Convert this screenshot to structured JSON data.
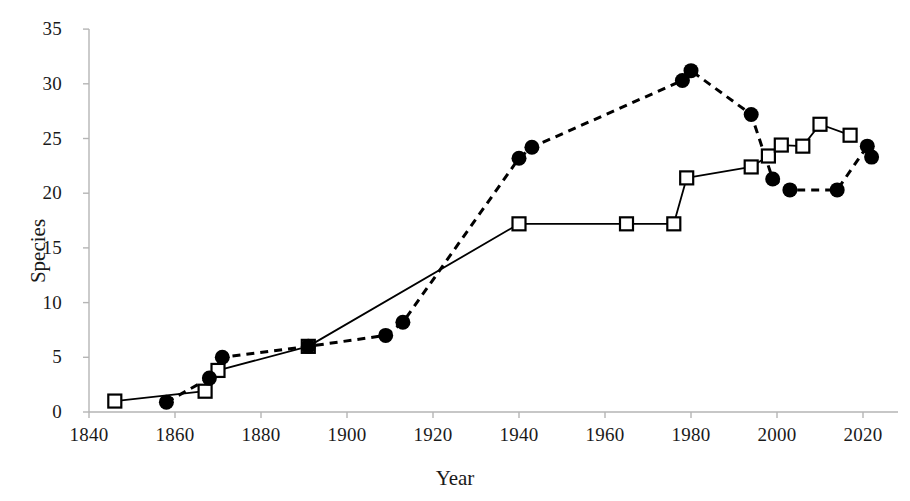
{
  "chart_data": {
    "type": "line",
    "title": "",
    "xlabel": "Year",
    "ylabel": "Species",
    "xlim": [
      1840,
      2024
    ],
    "ylim": [
      0,
      35
    ],
    "xticks": [
      1840,
      1860,
      1880,
      1900,
      1920,
      1940,
      1960,
      1980,
      2000,
      2020
    ],
    "yticks": [
      0,
      5,
      10,
      15,
      20,
      25,
      30,
      35
    ],
    "grid": false,
    "legend": "none",
    "series": [
      {
        "name": "open-square-solid-line",
        "marker": "open-square",
        "line_style": "solid",
        "color": "#000000",
        "points": [
          {
            "x": 1846,
            "y": 1.0
          },
          {
            "x": 1867,
            "y": 1.9
          },
          {
            "x": 1870,
            "y": 3.8
          },
          {
            "x": 1891,
            "y": 6.0
          },
          {
            "x": 1940,
            "y": 17.2
          },
          {
            "x": 1965,
            "y": 17.2
          },
          {
            "x": 1976,
            "y": 17.2
          },
          {
            "x": 1979,
            "y": 21.4
          },
          {
            "x": 1994,
            "y": 22.4
          },
          {
            "x": 1998,
            "y": 23.4
          },
          {
            "x": 2001,
            "y": 24.4
          },
          {
            "x": 2006,
            "y": 24.3
          },
          {
            "x": 2010,
            "y": 26.3
          },
          {
            "x": 2017,
            "y": 25.3
          }
        ]
      },
      {
        "name": "filled-circle-dashed-line",
        "marker": "filled-circle",
        "line_style": "dashed",
        "color": "#000000",
        "points": [
          {
            "x": 1858,
            "y": 0.9
          },
          {
            "x": 1868,
            "y": 3.1
          },
          {
            "x": 1871,
            "y": 5.0
          },
          {
            "x": 1891,
            "y": 6.0
          },
          {
            "x": 1909,
            "y": 7.0
          },
          {
            "x": 1913,
            "y": 8.2
          },
          {
            "x": 1940,
            "y": 23.2
          },
          {
            "x": 1943,
            "y": 24.2
          },
          {
            "x": 1978,
            "y": 30.3
          },
          {
            "x": 1980,
            "y": 31.2
          },
          {
            "x": 1994,
            "y": 27.2
          },
          {
            "x": 1999,
            "y": 21.3
          },
          {
            "x": 2003,
            "y": 20.3
          },
          {
            "x": 2014,
            "y": 20.3
          },
          {
            "x": 2021,
            "y": 24.3
          },
          {
            "x": 2022,
            "y": 23.3
          }
        ]
      }
    ]
  },
  "axes": {
    "x_title": "Year",
    "y_title": "Species",
    "x_tick_labels": [
      "1840",
      "1860",
      "1880",
      "1900",
      "1920",
      "1940",
      "1960",
      "1980",
      "2000",
      "2020"
    ],
    "y_tick_labels": [
      "0",
      "5",
      "10",
      "15",
      "20",
      "25",
      "30",
      "35"
    ]
  },
  "colors": {
    "ink": "#1a1a1a",
    "axis": "#b5b5b5",
    "series": "#000000",
    "background": "#ffffff"
  }
}
